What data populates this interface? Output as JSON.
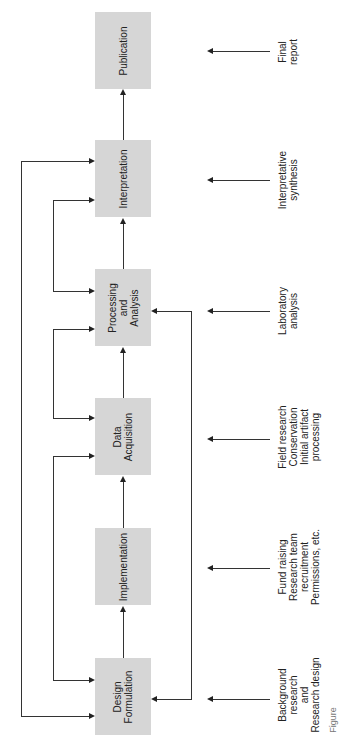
{
  "diagram": {
    "orientation": "rotated-90-ccw",
    "colors": {
      "box_fill": "#d6d6d6",
      "line": "#333333",
      "background": "#ffffff"
    },
    "stages": [
      {
        "id": "design",
        "label": "Design\nFormulation"
      },
      {
        "id": "implementation",
        "label": "Implementation"
      },
      {
        "id": "acquisition",
        "label": "Data\nAcquisition"
      },
      {
        "id": "processing",
        "label": "Processing\nand\nAnalysis"
      },
      {
        "id": "interpretation",
        "label": "Interpretation"
      },
      {
        "id": "publication",
        "label": "Publication"
      }
    ],
    "inputs": [
      {
        "stage": "design",
        "label": "Background\nresearch\nand\nResearch design"
      },
      {
        "stage": "implementation",
        "label": "Fund raising\nResearch team\nrecruitment\nPermissions, etc."
      },
      {
        "stage": "acquisition",
        "label": "Field research\nConservation\nInitial artifact\nprocessing"
      },
      {
        "stage": "processing",
        "label": "Laboratory\nanalysis"
      },
      {
        "stage": "interpretation",
        "label": "Interpretative\nsynthesis"
      },
      {
        "stage": "publication",
        "label": "Final\nreport"
      }
    ],
    "caption": "Figure"
  }
}
